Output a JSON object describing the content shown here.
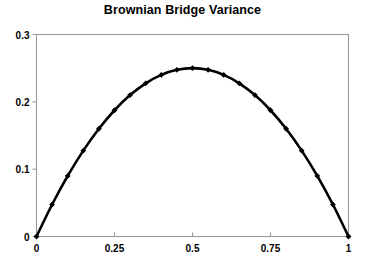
{
  "chart_data": {
    "type": "line",
    "title": "Brownian Bridge Variance",
    "xlabel": "",
    "ylabel": "",
    "xlim": [
      0,
      1
    ],
    "ylim": [
      0,
      0.3
    ],
    "grid": false,
    "legend": null,
    "marker": "diamond",
    "line_color": "#000000",
    "frame_color": "#9a9a9a",
    "function": "t(1-t)",
    "xticks": [
      "0",
      "0.25",
      "0.5",
      "0.75",
      "1"
    ],
    "xtick_values": [
      0,
      0.25,
      0.5,
      0.75,
      1
    ],
    "yticks": [
      "0",
      "0.1",
      "0.2",
      "0.3"
    ],
    "ytick_values": [
      0,
      0.1,
      0.2,
      0.3
    ],
    "x": [
      0,
      0.05,
      0.1,
      0.15,
      0.2,
      0.25,
      0.3,
      0.35,
      0.4,
      0.45,
      0.5,
      0.55,
      0.6,
      0.65,
      0.7,
      0.75,
      0.8,
      0.85,
      0.9,
      0.95,
      1
    ],
    "values": [
      0,
      0.0475,
      0.09,
      0.1275,
      0.16,
      0.1875,
      0.21,
      0.2275,
      0.24,
      0.2475,
      0.25,
      0.2475,
      0.24,
      0.2275,
      0.21,
      0.1875,
      0.16,
      0.1275,
      0.09,
      0.0475,
      0
    ],
    "series": [
      {
        "name": "Brownian Bridge Variance",
        "values": [
          0,
          0.0475,
          0.09,
          0.1275,
          0.16,
          0.1875,
          0.21,
          0.2275,
          0.24,
          0.2475,
          0.25,
          0.2475,
          0.24,
          0.2275,
          0.21,
          0.1875,
          0.16,
          0.1275,
          0.09,
          0.0475,
          0
        ]
      }
    ]
  }
}
